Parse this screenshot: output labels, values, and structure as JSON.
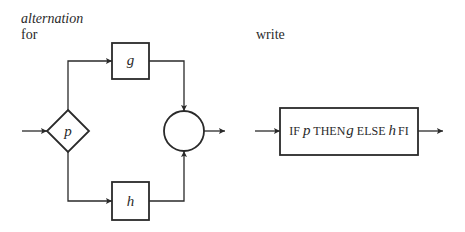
{
  "left_panel": {
    "heading_italic": "alternation",
    "heading_for": "for",
    "decision": {
      "label": "p",
      "shape": "diamond"
    },
    "branch_true": {
      "label": "g",
      "shape": "box"
    },
    "branch_false": {
      "label": "h",
      "shape": "box"
    },
    "join": {
      "label": "",
      "shape": "circle"
    }
  },
  "right_panel": {
    "heading": "write",
    "statement": {
      "kw_if": "IF",
      "p": "p",
      "kw_then": "THEN",
      "g": "g",
      "kw_else": "ELSE",
      "h": "h",
      "kw_fi": "FI"
    }
  },
  "colors": {
    "stroke": "#2a2a2a",
    "background": "#ffffff"
  }
}
